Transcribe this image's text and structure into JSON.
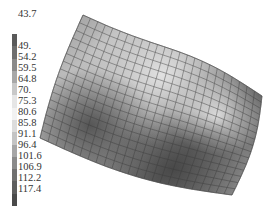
{
  "chart_data": {
    "type": "heatmap",
    "subtype": "3d-surface-mesh",
    "title": "",
    "xlabel": "",
    "ylabel": "",
    "colorbar": {
      "position": "left",
      "ticks": [
        "43.7",
        "49.",
        "54.2",
        "59.5",
        "64.8",
        "70.",
        "75.3",
        "80.6",
        "85.8",
        "91.1",
        "96.4",
        "101.6",
        "106.9",
        "112.2",
        "117.4"
      ],
      "range": [
        43.7,
        117.4
      ],
      "colors": [
        "#5a5a5a",
        "#6e6e6e",
        "#8a8a8a",
        "#a8a8a8",
        "#c8c8c8",
        "#e6e6e6",
        "#f2f2f2",
        "#dcdcdc",
        "#c4c4c4",
        "#a6a6a6",
        "#8a8a8a",
        "#707070",
        "#5e5e5e",
        "#4a4a4a"
      ]
    },
    "surface": {
      "grid": true,
      "rows": 16,
      "cols": 24,
      "corners": {
        "top_left": [
          83,
          15
        ],
        "top_right": [
          262,
          96
        ],
        "bottom_right": [
          232,
          195
        ],
        "bottom_left": [
          40,
          138
        ]
      },
      "shading_notes": "light band along upper-middle region, dark trough in left-center and lower-middle regions"
    }
  },
  "colorbar_labels": [
    "43.7",
    "49.",
    "54.2",
    "59.5",
    "64.8",
    "70.",
    "75.3",
    "80.6",
    "85.8",
    "91.1",
    "96.4",
    "101.6",
    "106.9",
    "112.2",
    "117.4"
  ]
}
